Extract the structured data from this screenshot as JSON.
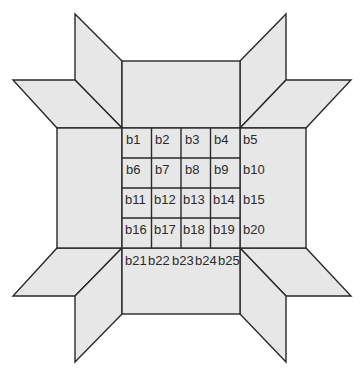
{
  "diagram": {
    "fill_color": "#e7e7e7",
    "stroke_color": "#2a2a2a",
    "grid_cells": [
      [
        "b1",
        "b2",
        "b3",
        "b4"
      ],
      [
        "b6",
        "b7",
        "b8",
        "b9"
      ],
      [
        "b11",
        "b12",
        "b13",
        "b14"
      ],
      [
        "b16",
        "b17",
        "b18",
        "b19"
      ]
    ],
    "right_column_labels": [
      "b5",
      "b10",
      "b15",
      "b20"
    ],
    "bottom_row_labels": [
      "b21",
      "b22",
      "b23",
      "b24",
      "b25"
    ]
  }
}
